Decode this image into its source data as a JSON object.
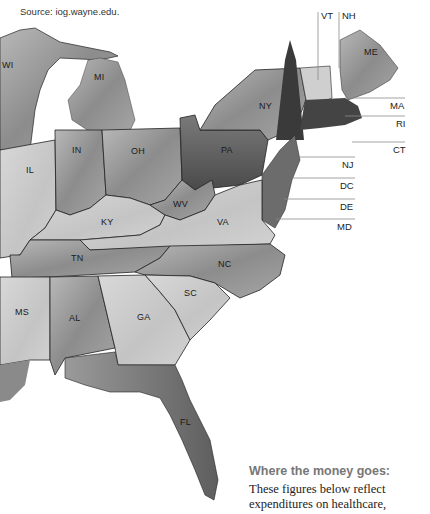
{
  "source": "Source: iog.wayne.edu.",
  "states": {
    "WI": "WI",
    "MI": "MI",
    "IL": "IL",
    "IN": "IN",
    "OH": "OH",
    "KY": "KY",
    "WV": "WV",
    "VA": "VA",
    "PA": "PA",
    "NY": "NY",
    "TN": "TN",
    "NC": "NC",
    "SC": "SC",
    "GA": "GA",
    "AL": "AL",
    "MS": "MS",
    "FL": "FL",
    "ME": "ME"
  },
  "leaders": {
    "VT": "VT",
    "NH": "NH",
    "MA": "MA",
    "RI": "RI",
    "CT": "CT",
    "NJ": "NJ",
    "DC": "DC",
    "DE": "DE",
    "MD": "MD"
  },
  "caption": {
    "title": "Where the money goes:",
    "body_line1": "These figures below reflect",
    "body_line2": "expenditures on healthcare,"
  },
  "colors": {
    "land_light": "#d6d6d6",
    "land_mid": "#a8a8a8",
    "land_dark": "#5a5a5a",
    "border": "#222222",
    "leader_line": "#888888",
    "caption_title": "#777777"
  }
}
